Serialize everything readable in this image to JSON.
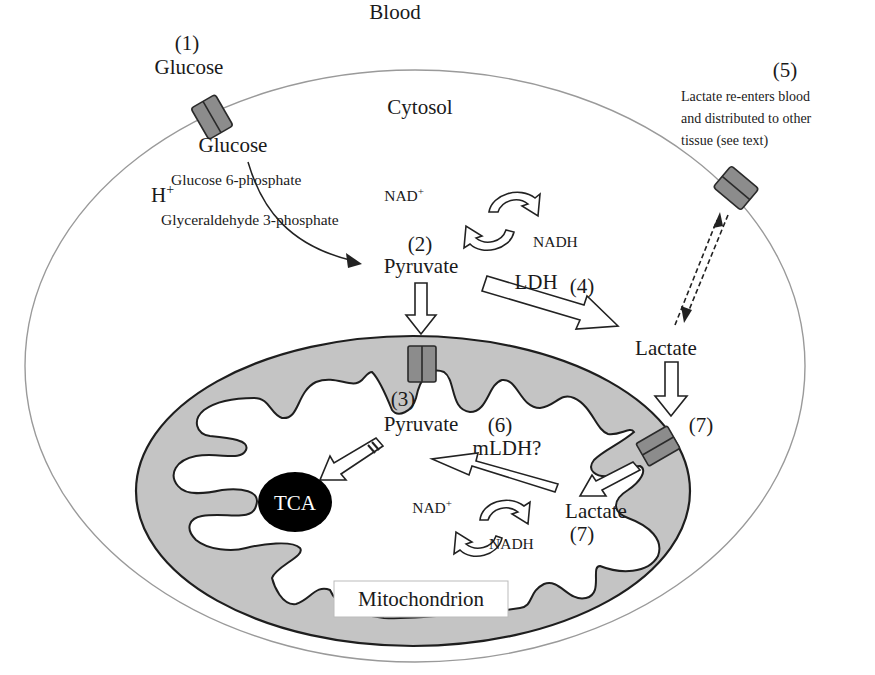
{
  "regions": {
    "blood": "Blood",
    "cytosol": "Cytosol",
    "mitochondrion": "Mitochondrion"
  },
  "step1": {
    "number": "(1)",
    "glucose_outside": "Glucose",
    "glucose_inside": "Glucose"
  },
  "glycolysis": {
    "glucose6p": "Glucose 6-phosphate",
    "proton": "H",
    "proton_sup": "+",
    "g3p": "Glyceraldehyde 3-phosphate"
  },
  "step2": {
    "number": "(2)",
    "pyruvate": "Pyruvate"
  },
  "cytosol_redox": {
    "nad": "NAD",
    "nad_sup": "+",
    "nadh": "NADH"
  },
  "step4": {
    "enzyme": "LDH",
    "number": "(4)",
    "lactate": "Lactate"
  },
  "step5": {
    "number": "(5)",
    "text_lines": [
      "Lactate re-enters blood",
      "and distributed to other",
      "tissue (see text)"
    ]
  },
  "step3": {
    "number": "(3)",
    "pyruvate": "Pyruvate"
  },
  "tca": {
    "label": "TCA"
  },
  "step6": {
    "number": "(6)",
    "enzyme": "mLDH?"
  },
  "mito_redox": {
    "nad": "NAD",
    "nad_sup": "+",
    "nadh": "NADH"
  },
  "step7": {
    "number_outer": "(7)",
    "lactate": "Lactate",
    "number_inner": "(7)"
  },
  "colors": {
    "membrane_fill": "#c4c4c4",
    "transporter_fill": "#8c8c8c",
    "tca_fill": "#000000",
    "cell_outline": "#9a9a9a"
  }
}
